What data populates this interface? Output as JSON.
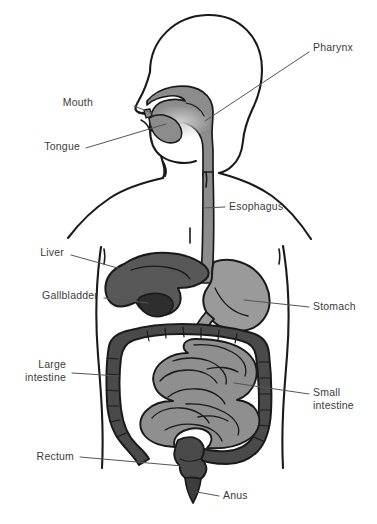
{
  "diagram": {
    "background_color": "#ffffff",
    "outline_color": "#1a1a1a",
    "label_color": "#3b3b3b",
    "leader_line_color": "#555555"
  },
  "palette": {
    "body_outline": "#1a1a1a",
    "pharynx_gray": "#8c8c8c",
    "esophagus_gray": "#8c8c8c",
    "liver_dark": "#585858",
    "gallbladder_darkest": "#2e2e2e",
    "stomach_mid": "#9a9a9a",
    "large_intestine_dark": "#4a4a4a",
    "small_intestine_light": "#8f8f8f",
    "rectum_dark": "#4a4a4a",
    "anus_dark": "#3d3d3d"
  },
  "labels": [
    {
      "id": "pharynx",
      "text": "Pharynx",
      "side": "right",
      "x": 313,
      "y": 48,
      "lines": 1
    },
    {
      "id": "mouth",
      "text": "Mouth",
      "side": "left",
      "x": 93,
      "y": 103,
      "lines": 1
    },
    {
      "id": "tongue",
      "text": "Tongue",
      "side": "left",
      "x": 14,
      "y": 147,
      "lines": 1
    },
    {
      "id": "esophagus",
      "text": "Esophagus",
      "side": "right",
      "x": 229,
      "y": 203,
      "lines": 1
    },
    {
      "id": "liver",
      "text": "Liver",
      "side": "left",
      "x": 38,
      "y": 252,
      "lines": 1
    },
    {
      "id": "gallbladder",
      "text": "Gallbladder",
      "side": "left",
      "x": 22,
      "y": 294,
      "lines": 1
    },
    {
      "id": "stomach",
      "text": "Stomach",
      "side": "right",
      "x": 313,
      "y": 303,
      "lines": 1
    },
    {
      "id": "large-intestine",
      "text": "Large\nintestine",
      "side": "left",
      "x": 22,
      "y": 360,
      "lines": 2
    },
    {
      "id": "small-intestine",
      "text": "Small\nintestine",
      "side": "right",
      "x": 313,
      "y": 390,
      "lines": 2
    },
    {
      "id": "rectum",
      "text": "Rectum",
      "side": "left",
      "x": 25,
      "y": 453,
      "lines": 1
    },
    {
      "id": "anus",
      "text": "Anus",
      "side": "right",
      "x": 223,
      "y": 492,
      "lines": 1
    }
  ],
  "organs": [
    {
      "id": "pharynx",
      "name": "Pharynx",
      "tone": "mid-gray"
    },
    {
      "id": "mouth",
      "name": "Mouth",
      "tone": "mid-gray"
    },
    {
      "id": "tongue",
      "name": "Tongue",
      "tone": "mid-gray"
    },
    {
      "id": "esophagus",
      "name": "Esophagus",
      "tone": "mid-gray"
    },
    {
      "id": "liver",
      "name": "Liver",
      "tone": "dark-gray"
    },
    {
      "id": "gallbladder",
      "name": "Gallbladder",
      "tone": "darkest-gray"
    },
    {
      "id": "stomach",
      "name": "Stomach",
      "tone": "light-mid-gray"
    },
    {
      "id": "large-intestine",
      "name": "Large intestine",
      "tone": "dark-gray"
    },
    {
      "id": "small-intestine",
      "name": "Small intestine",
      "tone": "light-gray"
    },
    {
      "id": "rectum",
      "name": "Rectum",
      "tone": "dark-gray"
    },
    {
      "id": "anus",
      "name": "Anus",
      "tone": "dark-gray"
    }
  ]
}
